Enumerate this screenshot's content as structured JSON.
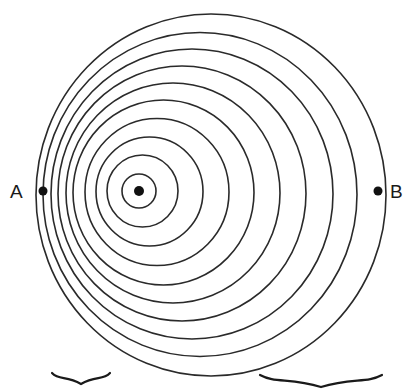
{
  "diagram": {
    "type": "wavefront-circles",
    "stroke_color": "#2a2a2a",
    "rings": [
      {
        "cx": 139,
        "cy": 191,
        "rx": 17,
        "ry": 17
      },
      {
        "cx": 142.5,
        "cy": 191,
        "rx": 35.5,
        "ry": 36
      },
      {
        "cx": 149.5,
        "cy": 191.5,
        "rx": 53.5,
        "ry": 54.5
      },
      {
        "cx": 157,
        "cy": 192,
        "rx": 72,
        "ry": 73.5
      },
      {
        "cx": 163.5,
        "cy": 192.5,
        "rx": 90.5,
        "ry": 92.5
      },
      {
        "cx": 173,
        "cy": 193,
        "rx": 107,
        "ry": 110
      },
      {
        "cx": 182,
        "cy": 193.5,
        "rx": 124,
        "ry": 127.5
      },
      {
        "cx": 192,
        "cy": 194,
        "rx": 141,
        "ry": 145
      },
      {
        "cx": 200,
        "cy": 194.5,
        "rx": 157,
        "ry": 162
      },
      {
        "cx": 211,
        "cy": 195,
        "rx": 175,
        "ry": 181
      }
    ],
    "source_point": {
      "x": 139,
      "y": 191
    },
    "points": [
      {
        "label": "A",
        "x": 43,
        "y": 191
      },
      {
        "label": "B",
        "x": 378,
        "y": 191
      }
    ],
    "braces": [
      {
        "name": "short-wavelength-brace",
        "x1": 52,
        "x2": 110,
        "y": 373,
        "depth": 11
      },
      {
        "name": "long-wavelength-brace",
        "x1": 260,
        "x2": 382,
        "y": 375,
        "depth": 12
      }
    ]
  },
  "labels": {
    "a": "A",
    "b": "B"
  }
}
